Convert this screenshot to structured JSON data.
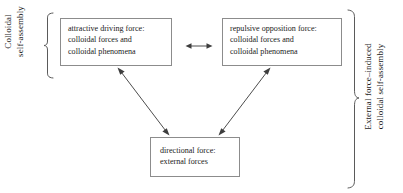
{
  "diagram": {
    "background_color": "#ffffff",
    "box_border_color": "#8c8c8c",
    "line_color": "#4d4d4d",
    "text_color": "#1a1a1a",
    "nodes": [
      {
        "id": "attractive",
        "text": "attractive driving force:\ncolloidal forces and\ncolloidal phenomena"
      },
      {
        "id": "repulsive",
        "text": "repulsive opposition force:\ncolloidal forces and\ncolloidal phenomena"
      },
      {
        "id": "directional",
        "text": "directional force:\nexternal forces"
      }
    ],
    "group_labels": {
      "left": "Colloidal\nself-assembly",
      "right": "External force–induced\ncolloidal self-assembly"
    },
    "connectors": [
      {
        "id": "attractive-repulsive",
        "from": "attractive",
        "to": "repulsive",
        "style": "double-headed-horizontal"
      },
      {
        "id": "attractive-directional",
        "from": "attractive",
        "to": "directional",
        "style": "double-headed-diagonal"
      },
      {
        "id": "repulsive-directional",
        "from": "repulsive",
        "to": "directional",
        "style": "double-headed-diagonal"
      }
    ]
  }
}
